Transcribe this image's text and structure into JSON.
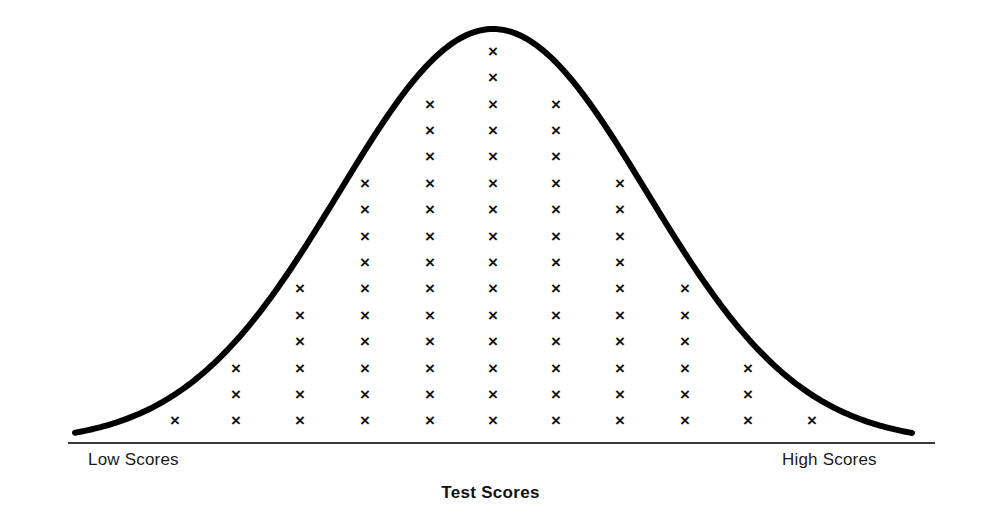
{
  "figure": {
    "title": "Test Scores",
    "left_axis_label": "Low Scores",
    "right_axis_label": "High Scores",
    "mark_glyph": "×",
    "curve_color": "#000000",
    "baseline_color": "#3a3a3a",
    "mark_color": "#141414"
  },
  "chart_data": {
    "type": "bar",
    "title": "Test Scores",
    "subtitle": "",
    "xlabel": "Test Scores",
    "ylabel": "",
    "grid": false,
    "legend": "none",
    "categories": [
      "1",
      "2",
      "3",
      "4",
      "5",
      "6",
      "7",
      "8",
      "9",
      "10",
      "11"
    ],
    "tick_labels": [
      "Low Scores",
      "",
      "",
      "",
      "",
      "",
      "",
      "",
      "",
      "",
      "High Scores"
    ],
    "values": [
      1,
      3,
      6,
      10,
      13,
      15,
      13,
      10,
      6,
      3,
      1
    ],
    "value_unit": "students",
    "total": 81,
    "ylim": [
      0,
      15
    ],
    "xlim": [
      0,
      12
    ],
    "series": [
      {
        "name": "Students",
        "values": [
          1,
          3,
          6,
          10,
          13,
          15,
          13,
          10,
          6,
          3,
          1
        ]
      }
    ],
    "overlay_curve": {
      "type": "line",
      "name": "Normal distribution curve",
      "peak_category": "6",
      "peak_value": 15,
      "shape": "symmetric bell curve"
    },
    "annotations": [
      "Low Scores",
      "High Scores"
    ]
  },
  "geometry": {
    "columns_x": [
      175,
      236,
      300,
      365,
      430,
      493,
      556,
      620,
      685,
      748,
      812
    ],
    "counts": [
      1,
      3,
      6,
      10,
      13,
      15,
      13,
      10,
      6,
      3,
      1
    ],
    "base_y": 422,
    "row_step": 26.4,
    "baseline_y": 443,
    "baseline_x0": 68,
    "baseline_x1": 935,
    "curve_x0": 75,
    "curve_x1": 912,
    "curve_peak_x": 493,
    "curve_peak_y": 29,
    "curve_stroke_width": 6
  }
}
